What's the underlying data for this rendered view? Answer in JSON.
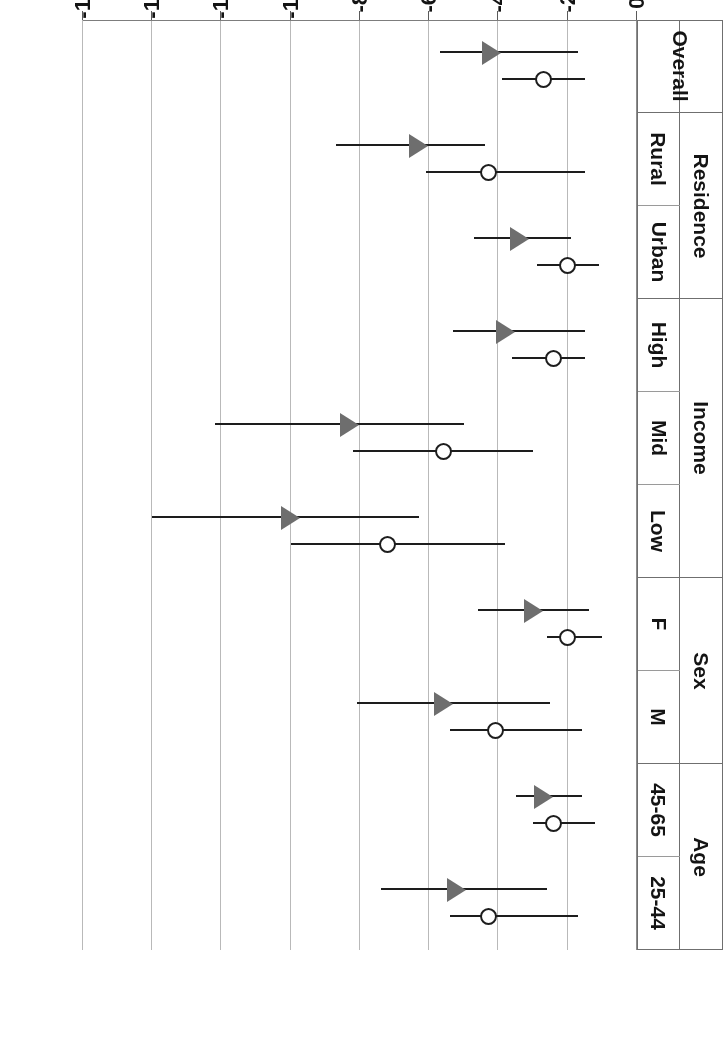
{
  "figure": {
    "axis_title": "% change in overweight and obesity prevalence",
    "orientation": "rotated-180"
  },
  "axis": {
    "ticks": [
      "0%",
      "-2%",
      "-4%",
      "-6%",
      "-8%",
      "-10%",
      "-12%",
      "-14%",
      "-16%"
    ],
    "tick_values": [
      0,
      -2,
      -4,
      -6,
      -8,
      -10,
      -12,
      -14,
      -16
    ]
  },
  "groups": [
    {
      "label": "Age",
      "subgroups": [
        "25-44",
        "45-65"
      ]
    },
    {
      "label": "Sex",
      "subgroups": [
        "M",
        "F"
      ]
    },
    {
      "label": "Income",
      "subgroups": [
        "Low",
        "Mid",
        "High"
      ]
    },
    {
      "label": "Residence",
      "subgroups": [
        "Urban",
        "Rural"
      ]
    },
    {
      "label": "Overall",
      "subgroups": [
        ""
      ]
    }
  ],
  "series": [
    {
      "name": "circle-series",
      "marker": "open-circle",
      "color": "#1d1d1d"
    },
    {
      "name": "triangle-series",
      "marker": "filled-triangle",
      "color": "#6e6e6e"
    }
  ],
  "chart_data": {
    "type": "scatter",
    "title": "",
    "subtitle": "",
    "xlabel": "",
    "ylabel": "% change in overweight and obesity prevalence",
    "ylim": [
      -16,
      0
    ],
    "grid": true,
    "legend": "none",
    "orientation": "horizontal-categories",
    "categories": [
      "25-44",
      "45-65",
      "M",
      "F",
      "Low",
      "Mid",
      "High",
      "Urban",
      "Rural",
      "Overall"
    ],
    "group_of_category": [
      "Age",
      "Age",
      "Sex",
      "Sex",
      "Income",
      "Income",
      "Income",
      "Residence",
      "Residence",
      "Overall"
    ],
    "series": [
      {
        "name": "circle-series",
        "marker": "open-circle",
        "values": [
          -4.3,
          -2.4,
          -4.1,
          -2.0,
          -7.2,
          -5.6,
          -2.4,
          -2.0,
          -4.3,
          -2.7
        ],
        "ci_low": [
          -1.7,
          -1.2,
          -1.6,
          -1.0,
          -3.8,
          -3.0,
          -1.5,
          -1.1,
          -1.5,
          -1.5
        ],
        "ci_high": [
          -5.4,
          -3.0,
          -5.4,
          -2.6,
          -10.0,
          -8.2,
          -3.6,
          -2.9,
          -6.1,
          -3.9
        ]
      },
      {
        "name": "triangle-series",
        "marker": "filled-triangle",
        "values": [
          -5.2,
          -2.7,
          -5.6,
          -3.0,
          -10.0,
          -8.3,
          -3.8,
          -3.4,
          -6.3,
          -4.2
        ],
        "ci_low": [
          -2.6,
          -1.6,
          -2.5,
          -1.4,
          -6.3,
          -5.0,
          -1.5,
          -1.9,
          -4.4,
          -1.7
        ],
        "ci_high": [
          -7.4,
          -3.5,
          -8.1,
          -4.6,
          -14.0,
          -12.2,
          -5.3,
          -4.7,
          -8.7,
          -5.7
        ]
      }
    ]
  }
}
